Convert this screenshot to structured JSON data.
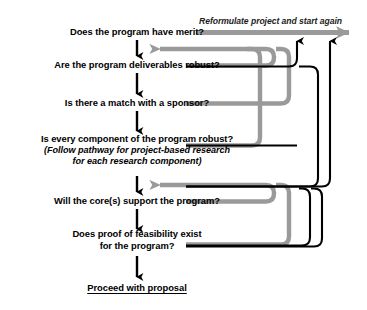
{
  "diagram": {
    "type": "flowchart",
    "colors": {
      "text": "#000000",
      "primary_path": "#000000",
      "feedback_path": "#9a9a9a"
    },
    "loop_caption": "Reformulate project and start again",
    "nodes": [
      {
        "id": "merit",
        "label": "Does the program have merit?",
        "x": 137,
        "y": 32
      },
      {
        "id": "deliverables",
        "label": "Are the program deliverables robust?",
        "x": 137,
        "y": 65
      },
      {
        "id": "sponsor",
        "label": "Is there a match with a sponsor?",
        "x": 137,
        "y": 103
      },
      {
        "id": "component",
        "label": "Is every component of the program robust?",
        "sub_line_1": "(Follow pathway for project-based research",
        "sub_line_2": "for each research component)",
        "x": 137,
        "y": 145
      },
      {
        "id": "cores",
        "label": "Will the core(s) support the program?",
        "x": 137,
        "y": 201
      },
      {
        "id": "feasibility",
        "label": "Does proof of feasibility exist",
        "sub_line_1": "for the program?",
        "x": 137,
        "y": 240
      },
      {
        "id": "proceed",
        "label": "Proceed with proposal",
        "x": 137,
        "y": 288
      }
    ],
    "main_arrows": [
      {
        "from": "merit",
        "to": "deliverables"
      },
      {
        "from": "deliverables",
        "to": "sponsor"
      },
      {
        "from": "sponsor",
        "to": "component"
      },
      {
        "from": "component",
        "to": "cores"
      },
      {
        "from": "cores",
        "to": "feasibility"
      },
      {
        "from": "feasibility",
        "to": "proceed"
      }
    ],
    "feedback_loops": [
      {
        "id": "loop-deliverables-to-merit",
        "color": "feedback_path",
        "from": "deliverables",
        "to": "merit"
      },
      {
        "id": "loop-sponsor-to-merit",
        "color": "feedback_path",
        "from": "sponsor",
        "to": "merit"
      },
      {
        "id": "loop-cores-to-component",
        "color": "feedback_path",
        "from": "cores",
        "to": "component"
      },
      {
        "id": "loop-feasibility-to-component",
        "color": "feedback_path",
        "from": "feasibility",
        "to": "component"
      },
      {
        "id": "loop-component-to-reformulate",
        "color": "primary_path",
        "from": "component",
        "to": "loop_caption"
      },
      {
        "id": "loop-cores-to-reformulate",
        "color": "primary_path",
        "from": "cores",
        "to": "loop_caption"
      },
      {
        "id": "loop-feasibility-to-reformulate",
        "color": "primary_path",
        "from": "feasibility",
        "to": "loop_caption"
      }
    ]
  }
}
